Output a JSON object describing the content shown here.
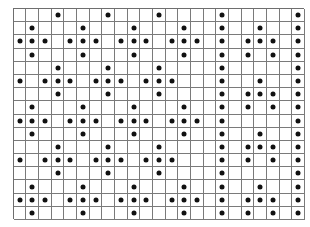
{
  "grid": {
    "columns": 23,
    "rows": 16,
    "line_color": "#7a7a7a",
    "dot_color": "#111111",
    "background": "#ffffff",
    "dots_by_row": [
      [
        3,
        7,
        11,
        16,
        22
      ],
      [
        1,
        5,
        9,
        13,
        16,
        19,
        22
      ],
      [
        0,
        1,
        2,
        4,
        5,
        6,
        8,
        9,
        10,
        12,
        13,
        14,
        16,
        18,
        19,
        20,
        22
      ],
      [
        1,
        5,
        9,
        13,
        16,
        18,
        20,
        22
      ],
      [
        3,
        7,
        11,
        16,
        22
      ],
      [
        0,
        2,
        3,
        4,
        6,
        7,
        8,
        10,
        11,
        12,
        16,
        19,
        22
      ],
      [
        3,
        7,
        11,
        16,
        18,
        19,
        20,
        22
      ],
      [
        1,
        5,
        9,
        13,
        16,
        18,
        20,
        22
      ],
      [
        0,
        1,
        2,
        4,
        5,
        6,
        8,
        9,
        10,
        12,
        13,
        14,
        16,
        22
      ],
      [
        1,
        5,
        9,
        13,
        16,
        19,
        22
      ],
      [
        3,
        7,
        11,
        16,
        18,
        19,
        20,
        22
      ],
      [
        0,
        2,
        3,
        4,
        6,
        7,
        8,
        10,
        11,
        12,
        16,
        18,
        20,
        22
      ],
      [
        3,
        7,
        11,
        16,
        22
      ],
      [
        1,
        5,
        9,
        13,
        16,
        19,
        22
      ],
      [
        0,
        1,
        2,
        4,
        5,
        6,
        8,
        9,
        10,
        12,
        13,
        14,
        16,
        18,
        19,
        20,
        22
      ],
      [
        1,
        5,
        9,
        13,
        16,
        18,
        20,
        22
      ]
    ]
  }
}
